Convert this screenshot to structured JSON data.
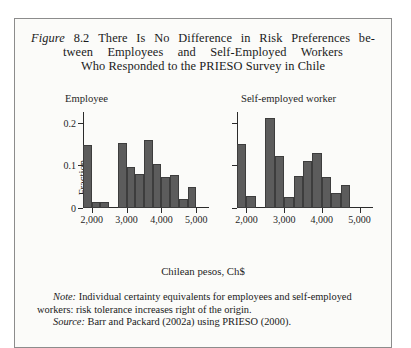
{
  "figure": {
    "label": "Figure",
    "number": "8.2",
    "title_lines": [
      "There Is No Difference in Risk Preferences be-",
      "tween Employees and Self-Employed Workers",
      "Who Responded to the PRIESO Survey in Chile"
    ],
    "xaxis_label": "Chilean pesos, Ch$",
    "note_lead": "Note:",
    "note_text": " Individual certainty equivalents for employees and self-employed workers: risk tolerance increases right of the origin.",
    "source_lead": "Source:",
    "source_text": " Barr and Packard (2002a) using PRIESO (2000).",
    "colors": {
      "bar_fill": "#5c5c5c",
      "bar_edge": "#3d3d3d",
      "axis": "#2b2b2b",
      "frame": "#8c8c8c",
      "background": "#fbfbf9"
    }
  },
  "chart_data": [
    {
      "type": "bar",
      "title": "Employee",
      "xlabel": "Chilean pesos, Ch$",
      "ylabel": "Fraction",
      "xlim": [
        1750,
        5250
      ],
      "ylim": [
        0,
        0.225
      ],
      "yticks": [
        0,
        0.1,
        0.2
      ],
      "ytick_labels": [
        "0",
        "0.1",
        "0.2"
      ],
      "xticks": [
        2000,
        3000,
        4000,
        5000
      ],
      "xtick_labels": [
        "2,000",
        "3,000",
        "4,000",
        "5,000"
      ],
      "grid": false,
      "legend": "none",
      "bin_width": 250,
      "bins": [
        1875,
        2125,
        2375,
        2625,
        2875,
        3125,
        3375,
        3625,
        3875,
        4125,
        4375,
        4625,
        4875
      ],
      "values": [
        0.148,
        0.013,
        0.013,
        0.0,
        0.153,
        0.095,
        0.08,
        0.16,
        0.102,
        0.072,
        0.078,
        0.02,
        0.05
      ]
    },
    {
      "type": "bar",
      "title": "Self-employed worker",
      "xlabel": "Chilean pesos, Ch$",
      "ylabel": "Fraction",
      "xlim": [
        1750,
        5250
      ],
      "ylim": [
        0,
        0.225
      ],
      "yticks": [
        0,
        0.1,
        0.2
      ],
      "ytick_labels": [
        "0",
        "0.1",
        "0.2"
      ],
      "xticks": [
        2000,
        3000,
        4000,
        5000
      ],
      "xtick_labels": [
        "2,000",
        "3,000",
        "4,000",
        "5,000"
      ],
      "grid": false,
      "legend": "none",
      "bin_width": 250,
      "bins": [
        1875,
        2125,
        2375,
        2625,
        2875,
        3125,
        3375,
        3625,
        3875,
        4125,
        4375,
        4625,
        4875
      ],
      "values": [
        0.15,
        0.028,
        0.0,
        0.21,
        0.122,
        0.025,
        0.075,
        0.11,
        0.13,
        0.072,
        0.035,
        0.055,
        0.0
      ]
    }
  ]
}
